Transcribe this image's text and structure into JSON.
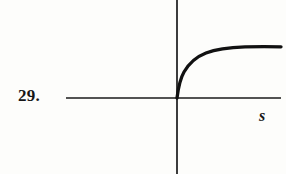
{
  "figure": {
    "problem_number": "29.",
    "axis_label_x": "s",
    "background_color": "#fdfdfb",
    "ink_color": "#1a1a1a"
  },
  "chart_data": {
    "type": "line",
    "title": "",
    "xlabel": "s",
    "ylabel": "",
    "grid": false,
    "legend": null,
    "axes": {
      "origin_px": [
        177,
        98
      ],
      "x_axis_px": {
        "y": 98,
        "x_start": 66,
        "x_end": 281
      },
      "y_axis_px": {
        "x": 177,
        "y_start": 0,
        "y_end": 174
      }
    },
    "x": [
      0,
      2,
      4,
      6,
      10,
      16,
      24,
      34,
      46,
      60,
      76,
      94,
      104
    ],
    "y": [
      0,
      16,
      23,
      28,
      34,
      39,
      43,
      46,
      48,
      50,
      51,
      51,
      51
    ],
    "x_px": [
      177,
      179,
      181,
      183,
      187,
      193,
      201,
      211,
      223,
      237,
      253,
      271,
      281
    ],
    "y_px": [
      98,
      82,
      75,
      70,
      64,
      59,
      55,
      52,
      50,
      48,
      47,
      47,
      47
    ],
    "path": "M 177 98 C 178.2 88.5 180.0 79.0 184.0 72.0 C 189.5 62.5 197.0 56.5 206.0 53.0 C 217.0 48.8 231.0 47.4 245.0 46.9 C 258.0 46.5 271.0 46.6 281.0 46.8",
    "xlim": [
      -32,
      104
    ],
    "ylim": [
      -38,
      62
    ]
  }
}
